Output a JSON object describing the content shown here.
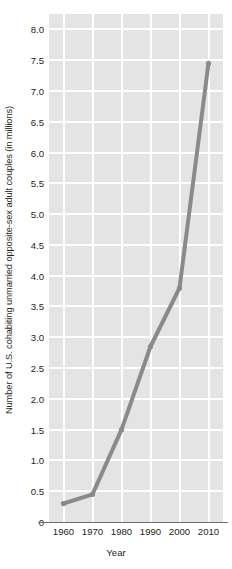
{
  "chart_data": {
    "type": "line",
    "title": "",
    "xlabel": "Year",
    "ylabel": "Number of U.S. cohabiting unmarried opposite-sex adult couples (in millions)",
    "x": [
      1960,
      1970,
      1980,
      1990,
      2000,
      2010
    ],
    "values": [
      0.3,
      0.45,
      1.5,
      2.85,
      3.8,
      7.45
    ],
    "categories": [
      "1960",
      "1970",
      "1980",
      "1990",
      "2000",
      "2010"
    ],
    "xlim": [
      1955,
      2015
    ],
    "ylim": [
      0,
      8.25
    ],
    "x_tick_labels": [
      "1960",
      "1970",
      "1980",
      "1990",
      "2000",
      "2010"
    ],
    "y_tick_labels": [
      "0",
      "0.5",
      "1.0",
      "1.5",
      "2.0",
      "2.5",
      "3.0",
      "3.5",
      "4.0",
      "4.5",
      "5.0",
      "5.5",
      "6.0",
      "6.5",
      "7.0",
      "7.5",
      "8.0"
    ],
    "y_tick_values": [
      0,
      0.5,
      1.0,
      1.5,
      2.0,
      2.5,
      3.0,
      3.5,
      4.0,
      4.5,
      5.0,
      5.5,
      6.0,
      6.5,
      7.0,
      7.5,
      8.0
    ],
    "grid": true,
    "legend": "none",
    "colors": {
      "plot_background": "#e4e4e4",
      "gridline": "#ffffff",
      "series_line": "#8a8a8a",
      "axis_line": "#6d6e71",
      "text": "#231f20"
    },
    "series": [
      {
        "name": "Cohabiting unmarried opposite-sex adult couples",
        "values": [
          0.3,
          0.45,
          1.5,
          2.85,
          3.8,
          7.45
        ]
      }
    ]
  }
}
